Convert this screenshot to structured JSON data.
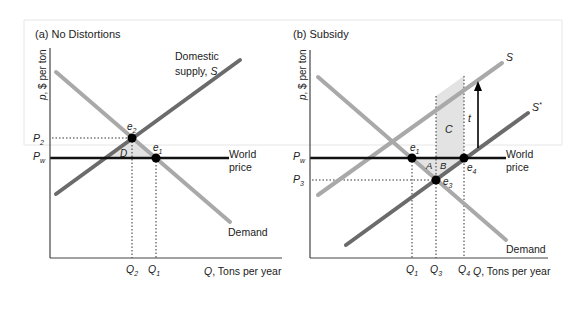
{
  "panels": [
    {
      "id": "a",
      "title": "(a) No Distortions",
      "y_axis_label": "p, $ per ton",
      "x_axis_label": "Q, Tons per year",
      "curves": {
        "supply_label_line1": "Domestic",
        "supply_label_line2": "supply, S",
        "demand_label": "Demand",
        "world_price_label_line1": "World",
        "world_price_label_line2": "price"
      },
      "price_ticks": [
        "P2",
        "Pw"
      ],
      "quantity_ticks": [
        "Q2",
        "Q1"
      ],
      "points": [
        "e2",
        "e1"
      ],
      "areas": [
        "D"
      ]
    },
    {
      "id": "b",
      "title": "(b) Subsidy",
      "y_axis_label": "p, $ per ton",
      "x_axis_label": "Q, Tons per year",
      "curves": {
        "supply_label": "S",
        "subsidized_supply_label": "S*",
        "demand_label": "Demand",
        "world_price_label_line1": "World",
        "world_price_label_line2": "price"
      },
      "price_ticks": [
        "Pw",
        "P3"
      ],
      "quantity_ticks": [
        "Q1",
        "Q3",
        "Q4"
      ],
      "points": [
        "e1",
        "e3",
        "e4"
      ],
      "areas": [
        "A",
        "B",
        "C"
      ],
      "subsidy_label": "t"
    }
  ],
  "colors": {
    "supply_dark": "#6b6b6b",
    "demand_light": "#a9a9a9",
    "world_price": "#111111",
    "shade": "#e3e3e3",
    "frame": "#e6e6e6"
  }
}
